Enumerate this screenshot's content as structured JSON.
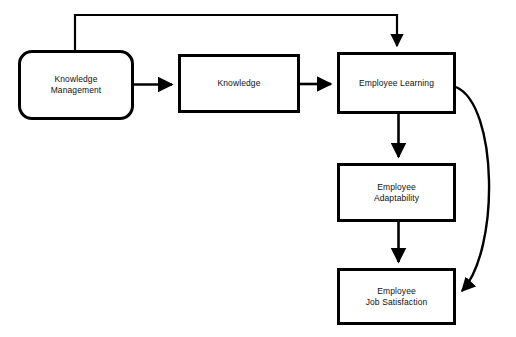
{
  "diagram": {
    "type": "flowchart",
    "title_fragment": "",
    "background_color": "#ffffff",
    "stroke_color": "#000000",
    "text_color": "#111111",
    "nodes": [
      {
        "id": "knowledge-management",
        "label": "Knowledge\nManagement",
        "shape": "rounded-rectangle",
        "x": 18,
        "y": 50,
        "width": 116,
        "height": 70
      },
      {
        "id": "knowledge",
        "label": "Knowledge",
        "shape": "rectangle",
        "x": 178,
        "y": 54,
        "width": 122,
        "height": 59
      },
      {
        "id": "employee-learning",
        "label": "Employee Learning",
        "shape": "rectangle",
        "x": 337,
        "y": 52,
        "width": 119,
        "height": 62
      },
      {
        "id": "employee-adaptability",
        "label": "Employee\nAdaptability",
        "shape": "rectangle",
        "x": 337,
        "y": 163,
        "width": 119,
        "height": 59
      },
      {
        "id": "employee-job-satisfaction",
        "label": "Employee\nJob Satisfaction",
        "shape": "rectangle",
        "x": 337,
        "y": 268,
        "width": 119,
        "height": 57
      }
    ],
    "edges": [
      {
        "id": "km-to-knowledge",
        "from": "knowledge-management",
        "to": "knowledge",
        "style": "straight",
        "arrowhead": "filled-triangle"
      },
      {
        "id": "knowledge-to-learning",
        "from": "knowledge",
        "to": "employee-learning",
        "style": "straight",
        "arrowhead": "filled-triangle"
      },
      {
        "id": "km-to-learning-top",
        "from": "knowledge-management",
        "to": "employee-learning",
        "style": "orthogonal-over-top",
        "arrowhead": "filled-triangle"
      },
      {
        "id": "learning-to-adaptability",
        "from": "employee-learning",
        "to": "employee-adaptability",
        "style": "straight-vertical",
        "arrowhead": "filled-triangle"
      },
      {
        "id": "adaptability-to-satisfaction",
        "from": "employee-adaptability",
        "to": "employee-job-satisfaction",
        "style": "straight-vertical",
        "arrowhead": "filled-triangle"
      },
      {
        "id": "learning-to-satisfaction-curve",
        "from": "employee-learning",
        "to": "employee-job-satisfaction",
        "style": "curved-right-bypass",
        "arrowhead": "filled-triangle"
      }
    ]
  }
}
